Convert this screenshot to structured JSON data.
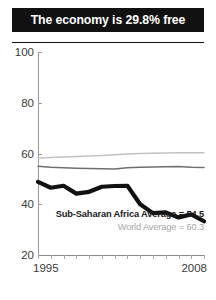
{
  "title": "The economy is 29.8% free",
  "legend": {
    "country_average": "Sub-Saharan Africa Average = 54.5",
    "world_average": "World Average = 60.3"
  },
  "colors": {
    "title_bar_background": "#111111",
    "title_text": "#ffffff",
    "country_series": "#111111",
    "regional_average_series": "#6e6e6e",
    "world_average_series": "#c2c2c2",
    "axis": "#9a9a9a",
    "tick_label": "#3a3a3a"
  },
  "chart_data": {
    "type": "line",
    "title": "The economy is 29.8% free",
    "xlabel": "",
    "ylabel": "",
    "xlim": [
      1995,
      2008
    ],
    "ylim": [
      20,
      100
    ],
    "yticks": [
      20,
      40,
      60,
      80,
      100
    ],
    "xticks": [
      1995,
      2008
    ],
    "xtick_labels": [
      "1995",
      "2008"
    ],
    "grid": false,
    "legend_position": "inside-bottom-right",
    "x": [
      1995,
      1996,
      1997,
      1998,
      1999,
      2000,
      2001,
      2002,
      2003,
      2004,
      2005,
      2006,
      2007,
      2008
    ],
    "series": [
      {
        "name": "Country score",
        "color": "#111111",
        "width": "thick",
        "values": [
          48.8,
          46.5,
          47.3,
          44.2,
          44.9,
          46.9,
          47.2,
          47.3,
          40.0,
          36.5,
          36.8,
          34.8,
          36.0,
          33.3
        ]
      },
      {
        "name": "Sub-Saharan Africa Average",
        "color": "#6e6e6e",
        "width": "thin",
        "values": [
          55.0,
          54.6,
          54.4,
          54.2,
          54.1,
          54.0,
          53.9,
          54.4,
          54.6,
          54.7,
          54.8,
          54.9,
          54.6,
          54.5
        ]
      },
      {
        "name": "World Average",
        "color": "#c2c2c2",
        "width": "thin",
        "values": [
          58.2,
          58.4,
          58.6,
          58.8,
          59.0,
          59.2,
          59.5,
          59.8,
          60.0,
          60.1,
          60.2,
          60.3,
          60.3,
          60.3
        ]
      }
    ],
    "annotations": [
      "Sub-Saharan Africa Average = 54.5",
      "World Average = 60.3"
    ]
  }
}
